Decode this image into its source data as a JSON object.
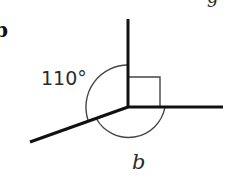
{
  "part_label": "b",
  "top_right_fragment": "g",
  "angle_label": "110°",
  "unknown_label": "b",
  "colors": {
    "line": "#111111",
    "arc": "#444444",
    "text": "#2a2a2a"
  },
  "geometry": {
    "vertex": [
      128,
      107
    ],
    "rays": [
      {
        "name": "up",
        "end": [
          128,
          19
        ]
      },
      {
        "name": "right",
        "end": [
          223,
          107
        ]
      },
      {
        "name": "lower-left",
        "end": [
          30,
          142
        ]
      }
    ],
    "right_angle_marker": {
      "between": [
        "up",
        "right"
      ],
      "size": 31
    },
    "angles": [
      {
        "label": "110°",
        "between": [
          "up",
          "lower-left"
        ]
      },
      {
        "label": "b",
        "between": [
          "lower-left",
          "right"
        ]
      },
      {
        "label": "90° (right angle)",
        "between": [
          "up",
          "right"
        ]
      }
    ]
  }
}
